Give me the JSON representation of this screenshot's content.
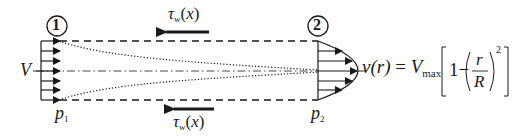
{
  "diagram": {
    "type": "control-volume pipe flow (entrance region)",
    "sections": [
      {
        "id": "section-1",
        "label": "1",
        "pressure_label": "p",
        "pressure_sub": "1"
      },
      {
        "id": "section-2",
        "label": "2",
        "pressure_label": "p",
        "pressure_sub": "2"
      }
    ],
    "inlet_velocity_label": "V",
    "wall_shear": {
      "top": {
        "symbol": "τ",
        "sub": "w",
        "arg": "(x)"
      },
      "bottom": {
        "symbol": "τ",
        "sub": "w",
        "arg": "(x)"
      }
    },
    "profile_equation": {
      "lhs": "v(r)",
      "equals": "=",
      "coef": "V",
      "coef_sub": "max",
      "bracket_open": "[",
      "one_minus": "1−",
      "frac_num": "r",
      "frac_den": "R",
      "exponent": "2",
      "bracket_close": "]"
    },
    "colors": {
      "ink": "#1a1a1a",
      "background": "#ffffff"
    }
  }
}
